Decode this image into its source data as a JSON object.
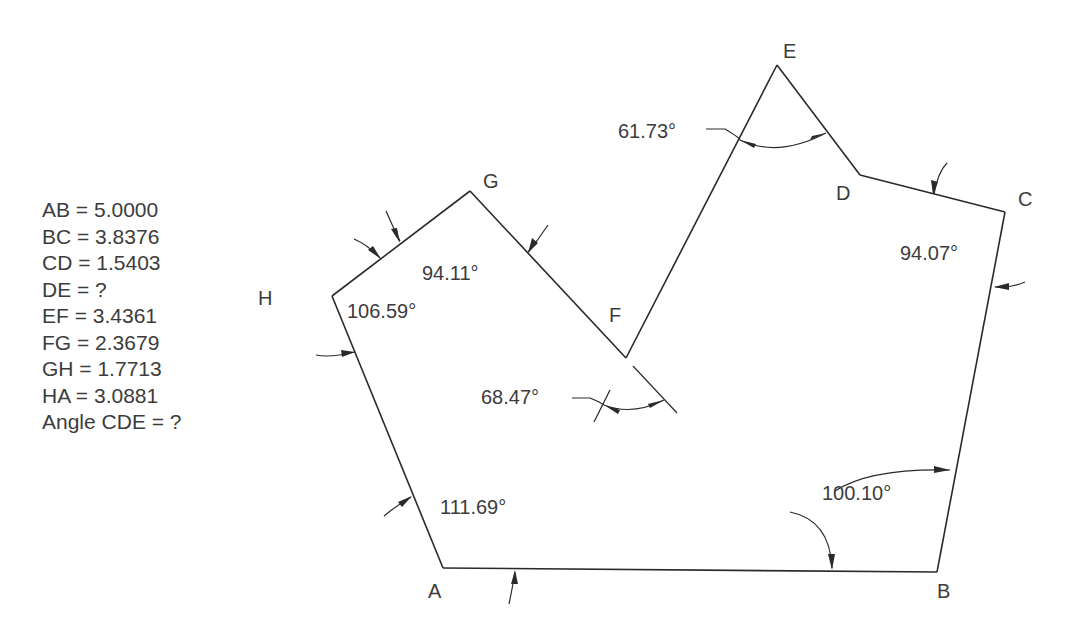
{
  "given": [
    {
      "label": "AB = 5.0000"
    },
    {
      "label": "BC = 3.8376"
    },
    {
      "label": "CD = 1.5403"
    },
    {
      "label": "DE = ?"
    },
    {
      "label": "EF = 3.4361"
    },
    {
      "label": "FG = 2.3679"
    },
    {
      "label": "GH = 1.7713"
    },
    {
      "label": "HA = 3.0881"
    },
    {
      "label": "Angle CDE = ?"
    }
  ],
  "vertices": {
    "A": "A",
    "B": "B",
    "C": "C",
    "D": "D",
    "E": "E",
    "F": "F",
    "G": "G",
    "H": "H"
  },
  "angles": {
    "A": "111.69°",
    "B": "100.10°",
    "C": "94.07°",
    "E": "61.73°",
    "F": "68.47°",
    "G": "94.11°",
    "H": "106.59°"
  },
  "colors": {
    "line": "#2a2a2a",
    "text": "#3c3c3c",
    "background": "#ffffff"
  }
}
